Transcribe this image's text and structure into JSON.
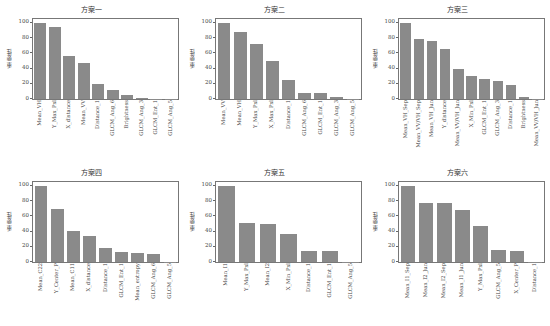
{
  "figure": {
    "ylabel": "重要性",
    "yticks": [
      "0",
      "20",
      "40",
      "60",
      "80",
      "100"
    ]
  },
  "chart_data": [
    {
      "type": "bar",
      "title": "方案一",
      "ylabel": "重要性",
      "ylim": [
        0,
        105
      ],
      "categories": [
        "Mean_VH",
        "Y_Max_Pxl",
        "X_distance",
        "Mean_VV",
        "Distance_1",
        "GLCM_Ang_6",
        "Brightness",
        "GLCM_Ang_3",
        "GLCM_Ent_1",
        "GLCM_Ang_5"
      ],
      "values": [
        100,
        94,
        57,
        47,
        20,
        12,
        5,
        1,
        0.5,
        0.3
      ]
    },
    {
      "type": "bar",
      "title": "方案二",
      "ylabel": "重要性",
      "ylim": [
        0,
        105
      ],
      "categories": [
        "Mean_VV",
        "Mean_VH",
        "Y_Max_Pxl",
        "X_Max_Pxl",
        "Distance_1",
        "GLCM_Ang_6",
        "GLCM_Ent_1",
        "GLCM_Ang_3",
        "GLCM_Ang_5"
      ],
      "values": [
        100,
        88,
        72,
        50,
        25,
        8,
        8,
        3,
        0.5
      ]
    },
    {
      "type": "bar",
      "title": "方案三",
      "ylabel": "重要性",
      "ylim": [
        0,
        105
      ],
      "categories": [
        "Mean_VH_Sep",
        "Mean_VV/VH_Sep",
        "Mean_VH_Jun",
        "Y_distance",
        "Mean_VV/VH_Jun",
        "X_Min_Pxl",
        "GLCM_Ent_1",
        "GLCM_Ang_3",
        "Distance_1",
        "Brightness",
        "Mean_VV/VH_Jun"
      ],
      "values": [
        100,
        79,
        76,
        66,
        40,
        30,
        26,
        24,
        19,
        2,
        0.5
      ]
    },
    {
      "type": "bar",
      "title": "方案四",
      "ylabel": "重要性",
      "ylim": [
        0,
        105
      ],
      "categories": [
        "Mean_C22",
        "Y_Center_P",
        "Mean_C11",
        "X_distance",
        "Distance_1",
        "GLCM_Ent_1",
        "Mean_entropy",
        "GLCM_Ang_6",
        "GLCM_Ang_5"
      ],
      "values": [
        100,
        70,
        41,
        34,
        18,
        13,
        12,
        10,
        0.5
      ]
    },
    {
      "type": "bar",
      "title": "方案五",
      "ylabel": "重要性",
      "ylim": [
        0,
        105
      ],
      "categories": [
        "Mean_I1",
        "Y_Max_Pxl",
        "Mean_I2",
        "X_Min_Pxl",
        "Distance_1",
        "GLCM_Ent_1",
        "GLCM_Ang_5"
      ],
      "values": [
        100,
        51,
        50,
        37,
        15,
        14,
        0.5
      ]
    },
    {
      "type": "bar",
      "title": "方案六",
      "ylabel": "重要性",
      "ylim": [
        0,
        105
      ],
      "categories": [
        "Mean_I1_Sep",
        "Mean_I2_Jun",
        "Mean_I2_Sep",
        "Mean_I1_Jun",
        "Y_Max_Pxl",
        "GLCM_Ang_5",
        "X_Center_P",
        "Distance_1"
      ],
      "values": [
        100,
        78,
        77,
        68,
        47,
        16,
        15,
        0.5
      ]
    }
  ]
}
